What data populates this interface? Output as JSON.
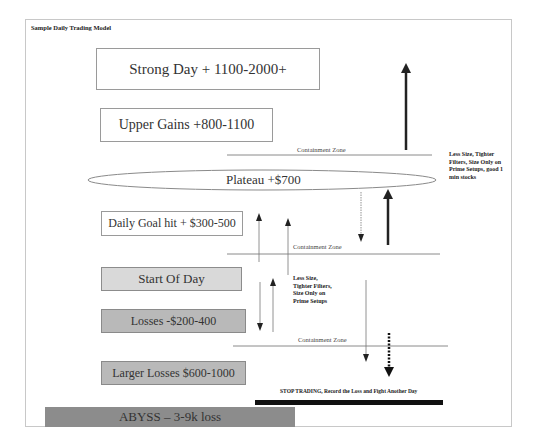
{
  "diagram": {
    "title": "Sample Daily Trading Model",
    "levels": [
      {
        "id": "strong-day",
        "label": "Strong Day + 1100-2000+",
        "fill": "#ffffff"
      },
      {
        "id": "upper-gains",
        "label": "Upper Gains +800-1100",
        "fill": "#ffffff"
      },
      {
        "id": "plateau",
        "label": "Plateau +$700",
        "shape": "ellipse",
        "fill": "#ffffff"
      },
      {
        "id": "daily-goal",
        "label": "Daily Goal hit + $300-500",
        "fill": "#ffffff"
      },
      {
        "id": "start-of-day",
        "label": "Start Of Day",
        "fill": "#d9d9d9"
      },
      {
        "id": "losses",
        "label": "Losses -$200-400",
        "fill": "#b9b9b9"
      },
      {
        "id": "larger-losses",
        "label": "Larger Losses $600-1000",
        "fill": "#b9b9b9"
      },
      {
        "id": "abyss",
        "label": "ABYSS – 3-9k loss",
        "fill": "#8c8c8c"
      }
    ],
    "containment_zones": [
      {
        "label": "Containment Zone"
      },
      {
        "label": "Containment Zone"
      },
      {
        "label": "Containment Zone"
      }
    ],
    "notes": {
      "upper": "Less Size, Tighter Filters, Size Only on Prime Setups, good 1 min stocks",
      "lower": "Less Size, Tighter Filters, Size Only on Prime Setups"
    },
    "stop_message": "STOP TRADING, Record the Loss and Fight Another Day",
    "colors": {
      "arrow": "#222222",
      "thin_arrow": "#555555",
      "zone_line": "#8a8a8a",
      "stop_bar": "#111111"
    }
  }
}
